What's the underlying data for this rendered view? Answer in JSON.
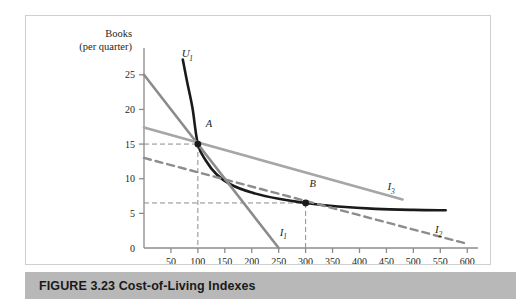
{
  "figure": {
    "caption_number": "FIGURE 3.23",
    "caption_title": "Cost-of-Living Indexes",
    "caption_full": "FIGURE 3.23  Cost-of-Living Indexes"
  },
  "chart_data": {
    "type": "line",
    "title": "",
    "xlabel": "Food (lb. per quarter)",
    "ylabel_line1": "Books",
    "ylabel_line2": "(per quarter)",
    "xlim": [
      0,
      620
    ],
    "ylim": [
      0,
      28
    ],
    "xticks": [
      50,
      100,
      150,
      200,
      250,
      300,
      350,
      400,
      450,
      500,
      550,
      600
    ],
    "yticks": [
      0,
      5,
      10,
      15,
      20,
      25
    ],
    "grid": false,
    "legend_position": "inline-curve-labels",
    "series": [
      {
        "name": "U1",
        "label": "U",
        "subscript": "1",
        "kind": "indifference-curve",
        "style": "solid",
        "color": "#1a1a1a",
        "width": 2.6,
        "points": [
          [
            72,
            27.2
          ],
          [
            80,
            24.0
          ],
          [
            90,
            20.2
          ],
          [
            100,
            15.0
          ],
          [
            115,
            12.6
          ],
          [
            135,
            10.6
          ],
          [
            160,
            9.2
          ],
          [
            200,
            8.0
          ],
          [
            250,
            7.1
          ],
          [
            300,
            6.5
          ],
          [
            360,
            6.0
          ],
          [
            430,
            5.65
          ],
          [
            500,
            5.5
          ],
          [
            560,
            5.45
          ]
        ],
        "label_at": [
          70,
          27.5
        ]
      },
      {
        "name": "I1",
        "label": "I",
        "subscript": "1",
        "kind": "budget-line",
        "style": "solid",
        "color": "#8c8c8c",
        "width": 2.6,
        "points": [
          [
            0,
            25.0
          ],
          [
            250,
            0
          ]
        ],
        "label_at": [
          252,
          1.7
        ]
      },
      {
        "name": "I2",
        "label": "I",
        "subscript": "2",
        "kind": "budget-line",
        "style": "dashed",
        "color": "#8c8c8c",
        "width": 2.4,
        "points": [
          [
            0,
            13.0
          ],
          [
            600,
            0.6
          ]
        ],
        "label_at": [
          540,
          2.1
        ]
      },
      {
        "name": "I3",
        "label": "I",
        "subscript": "3",
        "kind": "budget-line",
        "style": "solid",
        "color": "#a6a6a6",
        "width": 2.6,
        "points": [
          [
            0,
            17.4
          ],
          [
            480,
            7.0
          ]
        ],
        "label_at": [
          452,
          8.3
        ]
      }
    ],
    "points": [
      {
        "name": "A",
        "label": "A",
        "x": 100,
        "y": 15,
        "marker": "filled-circle",
        "color": "#1a1a1a",
        "label_offset": [
          8,
          2.2
        ],
        "dropline_x": true,
        "dropline_y": true
      },
      {
        "name": "B",
        "label": "B",
        "x": 300,
        "y": 6.5,
        "marker": "filled-circle",
        "color": "#1a1a1a",
        "label_offset": [
          4,
          2.0
        ],
        "dropline_x": true,
        "dropline_y": true
      }
    ],
    "droplines": {
      "style": "dashed",
      "color": "#8c8c8c",
      "width": 1
    },
    "annotations": []
  }
}
